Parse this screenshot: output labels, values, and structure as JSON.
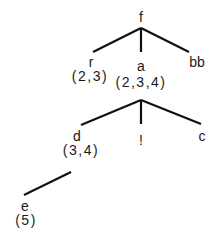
{
  "diagram": {
    "type": "tree",
    "nodes": {
      "root": {
        "label": "f"
      },
      "r": {
        "label": "r",
        "annotation": "(2,3)"
      },
      "a": {
        "label": "a",
        "annotation": "(2,3,4)"
      },
      "bb": {
        "label": "bb"
      },
      "d": {
        "label": "d",
        "annotation": "(3,4)"
      },
      "bang": {
        "label": "!"
      },
      "c": {
        "label": "c"
      },
      "e": {
        "label": "e",
        "annotation": "(5)"
      }
    },
    "edges": [
      {
        "from": "f",
        "to": "r"
      },
      {
        "from": "f",
        "to": "a"
      },
      {
        "from": "f",
        "to": "bb"
      },
      {
        "from": "a",
        "to": "d"
      },
      {
        "from": "a",
        "to": "!"
      },
      {
        "from": "a",
        "to": "c"
      },
      {
        "from": "d",
        "to": "e"
      }
    ],
    "colors": {
      "line": "#111111",
      "text": "#1a1a1a",
      "background": "#ffffff"
    }
  }
}
